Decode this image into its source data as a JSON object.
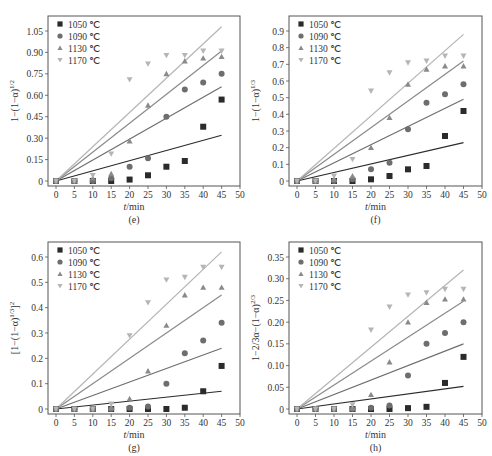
{
  "series_styles": [
    {
      "name": "1050 ℃",
      "marker": "square",
      "color": "#2b2b2b"
    },
    {
      "name": "1090 ℃",
      "marker": "circle",
      "color": "#6e6e6e"
    },
    {
      "name": "1130 ℃",
      "marker": "triangle-up",
      "color": "#8a8a8a"
    },
    {
      "name": "1170 ℃",
      "marker": "triangle-down",
      "color": "#b5b5b5"
    }
  ],
  "chart_data": [
    {
      "id": "e",
      "type": "scatter",
      "caption": "(e)",
      "ylabel": "1−(1−α)^{1/2}",
      "xlabel": "t/min",
      "xlim": [
        0,
        50
      ],
      "ylim": [
        0,
        1.05
      ],
      "xticks": [
        0,
        5,
        10,
        15,
        20,
        25,
        30,
        35,
        40,
        45,
        50
      ],
      "yticks": [
        0,
        0.15,
        0.3,
        0.45,
        0.6,
        0.75,
        0.9,
        1.05
      ],
      "ytick_labels": [
        "0",
        "0.15",
        "0.30",
        "0.45",
        "0.60",
        "0.75",
        "0.90",
        "1.05"
      ],
      "legend": [
        "1050 ℃",
        "1090 ℃",
        "1130 ℃",
        "1170 ℃"
      ],
      "x": [
        0,
        5,
        10,
        15,
        20,
        25,
        30,
        35,
        40,
        45
      ],
      "series": [
        {
          "name": "1050 ℃",
          "values": [
            0,
            0,
            0,
            0,
            0.01,
            0.04,
            0.1,
            0.14,
            0.38,
            0.57
          ],
          "fit_end": 0.32
        },
        {
          "name": "1090 ℃",
          "values": [
            0,
            0,
            0,
            0.02,
            0.1,
            0.16,
            0.45,
            0.64,
            0.69,
            0.75
          ],
          "fit_end": 0.66
        },
        {
          "name": "1130 ℃",
          "values": [
            0,
            0,
            0.02,
            0.05,
            0.28,
            0.53,
            0.75,
            0.84,
            0.86,
            0.87
          ],
          "fit_end": 0.91
        },
        {
          "name": "1170 ℃",
          "values": [
            0,
            0,
            0.04,
            0.19,
            0.71,
            0.82,
            0.88,
            0.88,
            0.91,
            0.91
          ],
          "fit_end": 1.08
        }
      ]
    },
    {
      "id": "f",
      "type": "scatter",
      "caption": "(f)",
      "ylabel": "1−(1−α)^{1/3}",
      "xlabel": "t/min",
      "xlim": [
        0,
        50
      ],
      "ylim": [
        0,
        0.9
      ],
      "xticks": [
        0,
        5,
        10,
        15,
        20,
        25,
        30,
        35,
        40,
        45,
        50
      ],
      "yticks": [
        0,
        0.1,
        0.2,
        0.3,
        0.4,
        0.5,
        0.6,
        0.7,
        0.8,
        0.9
      ],
      "ytick_labels": [
        "0",
        "0.1",
        "0.2",
        "0.3",
        "0.4",
        "0.5",
        "0.6",
        "0.7",
        "0.8",
        "0.9"
      ],
      "legend": [
        "1050 ℃",
        "1090 ℃",
        "1130 ℃",
        "1170 ℃"
      ],
      "x": [
        0,
        5,
        10,
        15,
        20,
        25,
        30,
        35,
        40,
        45
      ],
      "series": [
        {
          "name": "1050 ℃",
          "values": [
            0,
            0,
            0,
            0,
            0.01,
            0.03,
            0.07,
            0.09,
            0.27,
            0.42
          ],
          "fit_end": 0.23
        },
        {
          "name": "1090 ℃",
          "values": [
            0,
            0,
            0,
            0.01,
            0.07,
            0.11,
            0.31,
            0.47,
            0.52,
            0.58
          ],
          "fit_end": 0.49
        },
        {
          "name": "1130 ℃",
          "values": [
            0,
            0,
            0.01,
            0.03,
            0.2,
            0.38,
            0.58,
            0.67,
            0.69,
            0.69
          ],
          "fit_end": 0.72
        },
        {
          "name": "1170 ℃",
          "values": [
            0,
            0,
            0.03,
            0.13,
            0.54,
            0.65,
            0.71,
            0.72,
            0.75,
            0.75
          ],
          "fit_end": 0.88
        }
      ]
    },
    {
      "id": "g",
      "type": "scatter",
      "caption": "(g)",
      "ylabel": "[1−(1−α)^{1/3}]^2",
      "xlabel": "t/min",
      "xlim": [
        0,
        50
      ],
      "ylim": [
        0,
        0.6
      ],
      "xticks": [
        0,
        5,
        10,
        15,
        20,
        25,
        30,
        35,
        40,
        45,
        50
      ],
      "yticks": [
        0,
        0.1,
        0.2,
        0.3,
        0.4,
        0.5,
        0.6
      ],
      "ytick_labels": [
        "0",
        "0.1",
        "0.2",
        "0.3",
        "0.4",
        "0.5",
        "0.6"
      ],
      "legend": [
        "1050 ℃",
        "1090 ℃",
        "1130 ℃",
        "1170 ℃"
      ],
      "x": [
        0,
        5,
        10,
        15,
        20,
        25,
        30,
        35,
        40,
        45
      ],
      "series": [
        {
          "name": "1050 ℃",
          "values": [
            0,
            0,
            0,
            0,
            0,
            0,
            0,
            0.005,
            0.07,
            0.17
          ],
          "fit_end": 0.07
        },
        {
          "name": "1090 ℃",
          "values": [
            0,
            0,
            0,
            0,
            0.005,
            0.01,
            0.1,
            0.22,
            0.27,
            0.34
          ],
          "fit_end": 0.24
        },
        {
          "name": "1130 ℃",
          "values": [
            0,
            0,
            0,
            0.005,
            0.04,
            0.15,
            0.33,
            0.45,
            0.48,
            0.48
          ],
          "fit_end": 0.45
        },
        {
          "name": "1170 ℃",
          "values": [
            0,
            0,
            0,
            0.02,
            0.29,
            0.42,
            0.51,
            0.52,
            0.56,
            0.56
          ],
          "fit_end": 0.62
        }
      ]
    },
    {
      "id": "h",
      "type": "scatter",
      "caption": "(h)",
      "ylabel": "1−2/3α−(1−α)^{2/3}",
      "xlabel": "t/min",
      "xlim": [
        0,
        50
      ],
      "ylim": [
        0,
        0.35
      ],
      "xticks": [
        0,
        5,
        10,
        15,
        20,
        25,
        30,
        35,
        40,
        45,
        50
      ],
      "yticks": [
        0,
        0.05,
        0.1,
        0.15,
        0.2,
        0.25,
        0.3,
        0.35
      ],
      "ytick_labels": [
        "0",
        "0.05",
        "0.10",
        "0.15",
        "0.20",
        "0.25",
        "0.30",
        "0.35"
      ],
      "legend": [
        "1050 ℃",
        "1090 ℃",
        "1130 ℃",
        "1170 ℃"
      ],
      "x": [
        0,
        5,
        10,
        15,
        20,
        25,
        30,
        35,
        40,
        45
      ],
      "series": [
        {
          "name": "1050 ℃",
          "values": [
            0,
            0,
            0,
            0,
            0,
            0,
            0.002,
            0.005,
            0.06,
            0.12
          ],
          "fit_end": 0.052
        },
        {
          "name": "1090 ℃",
          "values": [
            0,
            0,
            0,
            0,
            0.003,
            0.008,
            0.077,
            0.15,
            0.175,
            0.2
          ],
          "fit_end": 0.15
        },
        {
          "name": "1130 ℃",
          "values": [
            0,
            0,
            0,
            0.002,
            0.033,
            0.108,
            0.2,
            0.245,
            0.253,
            0.253
          ],
          "fit_end": 0.248
        },
        {
          "name": "1170 ℃",
          "values": [
            0,
            0,
            0,
            0.01,
            0.182,
            0.235,
            0.263,
            0.268,
            0.276,
            0.276
          ],
          "fit_end": 0.32
        }
      ]
    }
  ],
  "panels": [
    {
      "x": 48,
      "y": 16,
      "w": 192,
      "h": 170
    },
    {
      "x": 289,
      "y": 16,
      "w": 193,
      "h": 170
    },
    {
      "x": 48,
      "y": 242,
      "w": 192,
      "h": 172
    },
    {
      "x": 289,
      "y": 242,
      "w": 193,
      "h": 172
    }
  ]
}
